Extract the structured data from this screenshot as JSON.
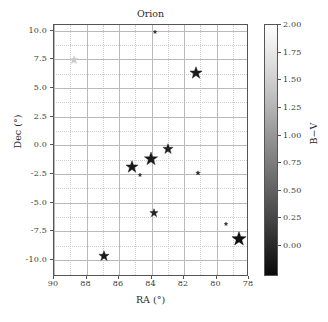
{
  "chart_data": {
    "type": "scatter",
    "title": "Orion",
    "xlabel": "RA (°)",
    "ylabel": "Dec (°)",
    "xlim": [
      90,
      78
    ],
    "ylim": [
      -11.5,
      10.5
    ],
    "x_inverted": true,
    "xticks": [
      "90",
      "88",
      "86",
      "84",
      "82",
      "80",
      "78"
    ],
    "xtick_values": [
      90,
      88,
      86,
      84,
      82,
      80,
      78
    ],
    "yticks": [
      "10.0",
      "7.5",
      "5.0",
      "2.5",
      "0.0",
      "-2.5",
      "-5.0",
      "-7.5",
      "-10.0"
    ],
    "ytick_values": [
      10.0,
      7.5,
      5.0,
      2.5,
      0.0,
      -2.5,
      -5.0,
      -7.5,
      -10.0
    ],
    "grid": true,
    "grid_minor": true,
    "marker": "star",
    "colormap": "gray",
    "colorbar": {
      "label": "B−V",
      "ticks": [
        "2.00",
        "1.75",
        "1.50",
        "1.25",
        "1.00",
        "0.75",
        "0.50",
        "0.25",
        "0.00"
      ],
      "tick_values": [
        2.0,
        1.75,
        1.5,
        1.25,
        1.0,
        0.75,
        0.5,
        0.25,
        0.0
      ],
      "vmin": 2.0,
      "vmax": -0.28,
      "top_color": "#ffffff",
      "bottom_color": "#0a0a0a"
    },
    "points": [
      {
        "name": "betelgeuse",
        "ra": 88.79,
        "dec": 7.41,
        "bv": 1.85,
        "size": 9,
        "color": "#c9c9c9"
      },
      {
        "name": "meissa",
        "ra": 83.78,
        "dec": 9.93,
        "bv": -0.16,
        "size": 4,
        "color": "#2b2b2b"
      },
      {
        "name": "bellatrix",
        "ra": 81.28,
        "dec": 6.35,
        "bv": -0.21,
        "size": 13,
        "color": "#1a1a1a"
      },
      {
        "name": "mintaka",
        "ra": 83.0,
        "dec": -0.3,
        "bv": -0.18,
        "size": 11,
        "color": "#1f1f1f"
      },
      {
        "name": "alnilam",
        "ra": 84.05,
        "dec": -1.2,
        "bv": -0.18,
        "size": 14,
        "color": "#1a1a1a"
      },
      {
        "name": "alnitak",
        "ra": 85.19,
        "dec": -1.94,
        "bv": -0.21,
        "size": 13,
        "color": "#1a1a1a"
      },
      {
        "name": "sigma-ori",
        "ra": 84.69,
        "dec": -2.6,
        "bv": -0.24,
        "size": 4,
        "color": "#2b2b2b"
      },
      {
        "name": "eta-ori",
        "ra": 81.12,
        "dec": -2.4,
        "bv": -0.17,
        "size": 5,
        "color": "#2b2b2b"
      },
      {
        "name": "iota-ori",
        "ra": 83.86,
        "dec": -5.91,
        "bv": -0.21,
        "size": 9,
        "color": "#222222"
      },
      {
        "name": "tau-ori",
        "ra": 79.4,
        "dec": -6.84,
        "bv": -0.1,
        "size": 4,
        "color": "#2b2b2b"
      },
      {
        "name": "rigel",
        "ra": 78.63,
        "dec": -8.2,
        "bv": -0.03,
        "size": 15,
        "color": "#111111"
      },
      {
        "name": "saiph",
        "ra": 86.94,
        "dec": -9.67,
        "bv": -0.17,
        "size": 11,
        "color": "#1a1a1a"
      }
    ]
  }
}
